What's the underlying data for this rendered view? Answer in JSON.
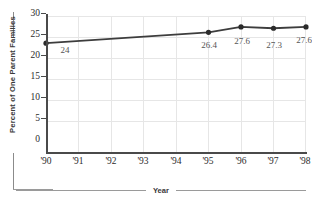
{
  "chart_data": {
    "type": "line",
    "title": "",
    "xlabel": "Year",
    "ylabel": "Percent of One Parent Families",
    "categories": [
      "'90",
      "'91",
      "'92",
      "'93",
      "'94",
      "'95",
      "'96",
      "'97",
      "'98"
    ],
    "x": [
      1990,
      1991,
      1992,
      1993,
      1994,
      1995,
      1996,
      1997,
      1998
    ],
    "series": [
      {
        "name": "Percent of One Parent Families",
        "marked_points": [
          {
            "category": "'90",
            "value": 24,
            "label": "24"
          },
          {
            "category": "'95",
            "value": 26.4,
            "label": "26.4"
          },
          {
            "category": "'96",
            "value": 27.6,
            "label": "27.6"
          },
          {
            "category": "'97",
            "value": 27.3,
            "label": "27.3"
          },
          {
            "category": "'98",
            "value": 27.6,
            "label": "27.6"
          }
        ],
        "values": [
          24,
          null,
          null,
          null,
          null,
          26.4,
          27.6,
          27.3,
          27.6
        ]
      }
    ],
    "ylim": [
      0,
      30
    ],
    "yticks": [
      0,
      5,
      10,
      15,
      20,
      25,
      30
    ],
    "ytick_labels": [
      "0",
      "5",
      "10",
      "15",
      "20",
      "25",
      "30"
    ],
    "grid": true,
    "legend": false,
    "line_color": "#3d3d3d",
    "marker_color": "#2b2b2b",
    "grid_color": "#e6e6e6",
    "axis_color": "#4a4a4a"
  },
  "axes": {
    "y": {
      "title": "Percent of One Parent Families",
      "ticks": [
        {
          "label": "30",
          "value": 30
        },
        {
          "label": "25",
          "value": 25
        },
        {
          "label": "20",
          "value": 20
        },
        {
          "label": "15",
          "value": 15
        },
        {
          "label": "10",
          "value": 10
        },
        {
          "label": "5",
          "value": 5
        },
        {
          "label": "0",
          "value": 0
        }
      ]
    },
    "x": {
      "title": "Year",
      "ticks": [
        {
          "label": "'90"
        },
        {
          "label": "'91"
        },
        {
          "label": "'92"
        },
        {
          "label": "'93"
        },
        {
          "label": "'94"
        },
        {
          "label": "'95"
        },
        {
          "label": "'96"
        },
        {
          "label": "'97"
        },
        {
          "label": "'98"
        }
      ]
    }
  }
}
